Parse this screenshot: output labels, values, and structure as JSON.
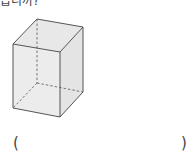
{
  "question": {
    "cut_text": "습니까?",
    "answer_open": "(",
    "answer_close": ")",
    "answer_value": ""
  },
  "figure": {
    "type": "rectangular-prism",
    "fill": "#e6e6e6",
    "stroke": "#555555"
  }
}
